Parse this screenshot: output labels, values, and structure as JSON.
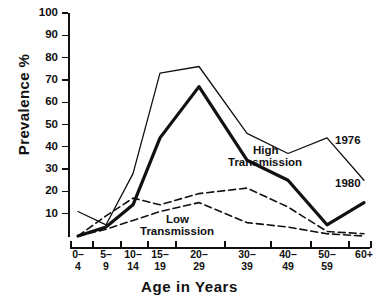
{
  "caption": "",
  "axes": {
    "ylabel": "Prevalence %",
    "xlabel": "Age in Years",
    "yticks": [
      "100",
      "90",
      "80",
      "70",
      "60",
      "50",
      "40",
      "30",
      "20",
      "10"
    ],
    "xticks": [
      {
        "top": "0–",
        "bottom": "4"
      },
      {
        "top": "5–",
        "bottom": "9"
      },
      {
        "top": "10–",
        "bottom": "14"
      },
      {
        "top": "15–",
        "bottom": "19"
      },
      {
        "top": "20–",
        "bottom": "29"
      },
      {
        "top": "30–",
        "bottom": "39"
      },
      {
        "top": "40–",
        "bottom": "49"
      },
      {
        "top": "50–",
        "bottom": "59"
      },
      {
        "top": "60+",
        "bottom": ""
      }
    ]
  },
  "annotations": {
    "year_1976": "1976",
    "year_1980": "1980",
    "high_line1": "High",
    "high_line2": "Transmission",
    "low_line1": "Low",
    "low_line2": "Transmission"
  },
  "colors": {
    "ink": "#111111",
    "background": "#ffffff"
  },
  "chart_data": {
    "type": "line",
    "title": "",
    "xlabel": "Age in Years",
    "ylabel": "Prevalence %",
    "ylim": [
      0,
      100
    ],
    "ytick_step": 10,
    "grid": false,
    "legend": "in-plot annotations",
    "categories": [
      "0-4",
      "5-9",
      "10-14",
      "15-19",
      "20-29",
      "30-39",
      "40-49",
      "50-59",
      "60+"
    ],
    "series": [
      {
        "name": "1976",
        "group": "High Transmission",
        "style": "thin solid",
        "values": [
          11,
          5,
          28,
          73,
          76,
          46,
          37,
          44,
          25
        ]
      },
      {
        "name": "1980",
        "group": "High Transmission",
        "style": "thick solid",
        "values": [
          0,
          4,
          14,
          44,
          67,
          34,
          25,
          5,
          15
        ]
      },
      {
        "name": "1976",
        "group": "Low Transmission",
        "style": "dashed",
        "values": [
          0,
          9,
          17,
          14,
          19,
          21.5,
          13,
          2,
          1
        ]
      },
      {
        "name": "1980",
        "group": "Low Transmission",
        "style": "dashed",
        "values": [
          0,
          3,
          7,
          11,
          15,
          6,
          4,
          1,
          0
        ]
      }
    ]
  }
}
